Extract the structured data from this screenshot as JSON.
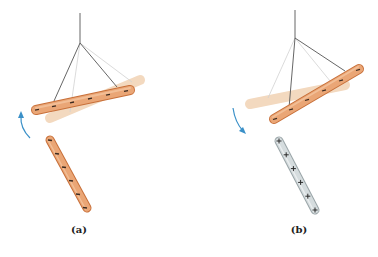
{
  "figure": {
    "colors": {
      "rod_orange": "#e8a070",
      "rod_orange_edge": "#c8703a",
      "rod_ghost": "#f3d9bf",
      "rod_glass": "#cfd6d8",
      "rod_glass_edge": "#9aa5a8",
      "string": "#555555",
      "string_ghost": "#cfcfcf",
      "arrow": "#3a90c8",
      "charge": "#3a2a20"
    },
    "panels": [
      {
        "id": "a",
        "caption": "(a)",
        "suspended_rod_charge": "negative",
        "nearby_rod_charge": "negative",
        "nearby_rod_material": "orange (rubber)",
        "rotation_direction": "counterclockwise (up, away)",
        "charge_symbols_suspended": [
          "−",
          "−",
          "−",
          "−",
          "−",
          "−"
        ],
        "charge_symbols_nearby": [
          "−",
          "−",
          "−",
          "−",
          "−",
          "−"
        ]
      },
      {
        "id": "b",
        "caption": "(b)",
        "suspended_rod_charge": "negative",
        "nearby_rod_charge": "positive",
        "nearby_rod_material": "glass",
        "rotation_direction": "clockwise (down, toward)",
        "charge_symbols_suspended": [
          "−",
          "−",
          "−",
          "−",
          "−",
          "−"
        ],
        "charge_symbols_nearby": [
          "+",
          "+",
          "+",
          "+",
          "+",
          "+"
        ]
      }
    ]
  }
}
